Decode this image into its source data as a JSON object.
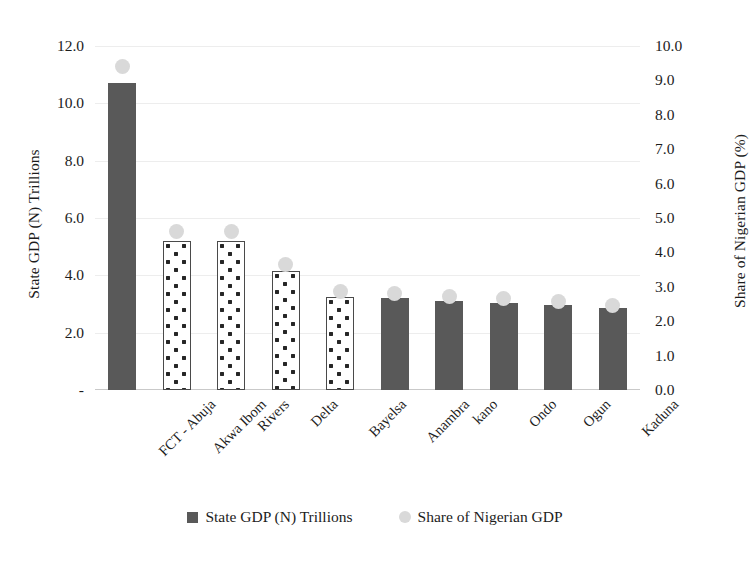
{
  "chart_data": {
    "type": "bar",
    "title": "",
    "subtitle": "",
    "xlabel": "",
    "ylabel": "State GDP (N) Trillions",
    "y2label": "Share of Nigerian GDP (%)",
    "categories": [
      "FCT - Abuja",
      "Akwa Ibom",
      "Rivers",
      "Delta",
      "Bayelsa",
      "Anambra",
      "kano",
      "Ondo",
      "Ogun",
      "Kaduna"
    ],
    "series": [
      {
        "name": "State GDP (N) Trillions",
        "type": "bar",
        "axis": "left",
        "color": "#595959",
        "values": [
          10.7,
          5.2,
          5.2,
          4.15,
          3.25,
          3.2,
          3.1,
          3.05,
          2.95,
          2.85
        ],
        "patterns": [
          "solid",
          "dotted",
          "dotted",
          "dotted",
          "dotted",
          "solid",
          "solid",
          "solid",
          "solid",
          "solid"
        ]
      },
      {
        "name": "Share of Nigerian GDP",
        "type": "scatter",
        "axis": "right",
        "color": "#d9d9d9",
        "values": [
          9.4,
          4.6,
          4.6,
          3.65,
          2.85,
          2.8,
          2.72,
          2.66,
          2.58,
          2.45
        ]
      }
    ],
    "ylim": [
      0,
      12
    ],
    "y2lim": [
      0,
      10
    ],
    "yticks": [
      "-",
      "2.0",
      "4.0",
      "6.0",
      "8.0",
      "10.0",
      "12.0"
    ],
    "ytick_values": [
      0,
      2,
      4,
      6,
      8,
      10,
      12
    ],
    "y2ticks": [
      "0.0",
      "1.0",
      "2.0",
      "3.0",
      "4.0",
      "5.0",
      "6.0",
      "7.0",
      "8.0",
      "9.0",
      "10.0"
    ],
    "y2tick_values": [
      0,
      1,
      2,
      3,
      4,
      5,
      6,
      7,
      8,
      9,
      10
    ],
    "grid": true,
    "legend_position": "bottom"
  },
  "legend": {
    "items": [
      {
        "label": "State GDP (N) Trillions",
        "swatch": "square",
        "color": "#595959"
      },
      {
        "label": "Share of Nigerian GDP",
        "swatch": "circle",
        "color": "#d9d9d9"
      }
    ]
  },
  "colors": {
    "bar_solid": "#595959",
    "bar_dot": "#262626",
    "marker": "#d9d9d9",
    "gridline": "#ededed",
    "axis": "#c9c9c9",
    "text": "#1c1c1c",
    "background": "#ffffff"
  }
}
